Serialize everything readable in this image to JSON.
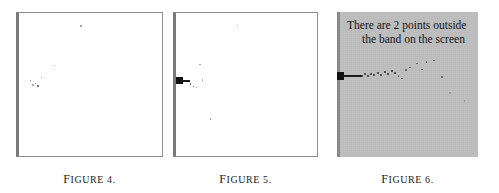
{
  "document": {
    "kind": "figure-row",
    "panel_count": 3,
    "background_color": "#ffffff",
    "screen_color": "#bfbfbf",
    "ink_color": "#1c1c1c",
    "rule_color": "#8e8e8e"
  },
  "figures": [
    {
      "id": "figure-4",
      "caption": "Figure 4.",
      "caption_lead": "F",
      "caption_rest": "IGURE 4.",
      "panel_style": "white",
      "screen_text": null,
      "has_axis_blob": false,
      "points": [
        {
          "x": 61.0,
          "y": 12.0,
          "tone": "faint"
        },
        {
          "x": 34.5,
          "y": 51.5,
          "tone": "faint"
        },
        {
          "x": 10.5,
          "y": 66.5,
          "tone": "normal"
        },
        {
          "x": 15.5,
          "y": 69.5,
          "tone": "normal"
        },
        {
          "x": 21.5,
          "y": 63.5,
          "tone": "faint"
        },
        {
          "x": 18.0,
          "y": 72.0,
          "tone": "normal"
        },
        {
          "x": 13.0,
          "y": 71.0,
          "tone": "faint"
        }
      ]
    },
    {
      "id": "figure-5",
      "caption": "Figure 5.",
      "caption_lead": "F",
      "caption_rest": "IGURE 5.",
      "panel_style": "white",
      "screen_text": null,
      "has_axis_blob": true,
      "blob": {
        "x": 0.0,
        "y": 64.0,
        "width": 7.0,
        "height": 7.0
      },
      "run": {
        "x": 5.0,
        "y": 67.0,
        "length": 9.0
      },
      "points": [
        {
          "x": 60.5,
          "y": 11.5,
          "tone": "faint"
        },
        {
          "x": 23.0,
          "y": 50.5,
          "tone": "faint"
        },
        {
          "x": 13.5,
          "y": 70.0,
          "tone": "normal"
        },
        {
          "x": 16.5,
          "y": 72.5,
          "tone": "normal"
        },
        {
          "x": 19.5,
          "y": 73.5,
          "tone": "faint"
        },
        {
          "x": 25.5,
          "y": 66.0,
          "tone": "faint"
        },
        {
          "x": 33.5,
          "y": 105.0,
          "tone": "faint"
        }
      ]
    },
    {
      "id": "figure-6",
      "caption": "Figure 6.",
      "caption_lead": "F",
      "caption_rest": "IGURE 6.",
      "panel_style": "screened",
      "screen_text": {
        "line1": "There are 2 points outside",
        "line2": "the band on the screen"
      },
      "has_axis_blob": true,
      "blob": {
        "x": 0.0,
        "y": 60.0,
        "width": 7.0,
        "height": 8.0
      },
      "run": {
        "x": 5.0,
        "y": 63.0,
        "length": 20.0
      },
      "points": [
        {
          "x": 24.0,
          "y": 62.5,
          "tone": "dark"
        },
        {
          "x": 27.0,
          "y": 61.0,
          "tone": "dark"
        },
        {
          "x": 30.0,
          "y": 62.5,
          "tone": "dark"
        },
        {
          "x": 33.0,
          "y": 60.5,
          "tone": "dark"
        },
        {
          "x": 36.0,
          "y": 62.0,
          "tone": "dark"
        },
        {
          "x": 39.5,
          "y": 60.0,
          "tone": "dark"
        },
        {
          "x": 43.0,
          "y": 61.5,
          "tone": "dark"
        },
        {
          "x": 46.5,
          "y": 59.0,
          "tone": "dark"
        },
        {
          "x": 50.0,
          "y": 60.5,
          "tone": "dark"
        },
        {
          "x": 53.5,
          "y": 57.5,
          "tone": "dark"
        },
        {
          "x": 57.0,
          "y": 59.5,
          "tone": "dark"
        },
        {
          "x": 60.5,
          "y": 63.0,
          "tone": "normal"
        },
        {
          "x": 64.0,
          "y": 65.5,
          "tone": "normal"
        },
        {
          "x": 68.0,
          "y": 57.0,
          "tone": "normal"
        },
        {
          "x": 72.0,
          "y": 54.5,
          "tone": "normal"
        },
        {
          "x": 79.0,
          "y": 50.5,
          "tone": "normal"
        },
        {
          "x": 84.0,
          "y": 56.5,
          "tone": "normal"
        },
        {
          "x": 88.5,
          "y": 49.0,
          "tone": "normal"
        },
        {
          "x": 96.0,
          "y": 47.5,
          "tone": "normal"
        },
        {
          "x": 104.0,
          "y": 64.0,
          "tone": "normal"
        },
        {
          "x": 112.0,
          "y": 80.0,
          "tone": "faint"
        },
        {
          "x": 126.5,
          "y": 88.0,
          "tone": "faint"
        }
      ]
    }
  ],
  "layout": {
    "panels": [
      {
        "left": 16,
        "top": 12,
        "width": 147,
        "height": 145,
        "caption_left": 16,
        "caption_width": 147
      },
      {
        "top": 12,
        "left": 173,
        "width": 145,
        "height": 145,
        "caption_left": 173,
        "caption_width": 145
      },
      {
        "top": 12,
        "left": 337,
        "width": 141,
        "height": 145,
        "caption_left": 337,
        "caption_width": 141
      }
    ]
  }
}
